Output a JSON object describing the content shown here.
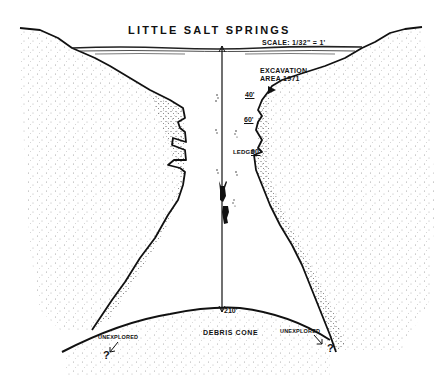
{
  "diagram": {
    "title": "LITTLE SALT SPRINGS",
    "scale": "SCALE: 1/32\" = 1'",
    "annotations": {
      "excavation_line1": "EXCAVATION",
      "excavation_line2": "AREA 1971",
      "depth_40": "40'",
      "depth_60": "60'",
      "ledge_label": "LEDGE",
      "depth_90": "90'",
      "depth_210": "210'",
      "debris_cone": "DEBRIS CONE",
      "unexplored_left": "UNEXPLORED",
      "unexplored_right": "UNEXPLORED",
      "question_left": "?",
      "question_right": "?"
    },
    "features": [
      "water-surface",
      "sinkhole-walls",
      "depth-rope",
      "divers",
      "debris-cone"
    ],
    "colors": {
      "ink": "#111111",
      "paper": "#ffffff",
      "stipple": "#555555"
    }
  }
}
